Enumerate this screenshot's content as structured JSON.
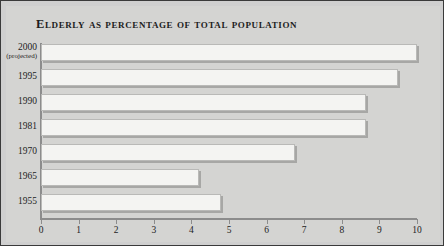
{
  "chart_data": {
    "type": "bar",
    "orientation": "horizontal",
    "title": "Elderly as percentage of total population",
    "xlabel": "",
    "ylabel": "",
    "xlim": [
      0,
      10
    ],
    "grid": false,
    "legend": null,
    "xticks": [
      "0",
      "1",
      "2",
      "3",
      "4",
      "5",
      "6",
      "7",
      "8",
      "9",
      "10"
    ],
    "categories": [
      "2000",
      "1995",
      "1990",
      "1981",
      "1970",
      "1965",
      "1955"
    ],
    "category_sublabels": [
      "(projected)",
      "",
      "",
      "",
      "",
      "",
      ""
    ],
    "values": [
      10.0,
      9.5,
      8.65,
      8.65,
      6.75,
      4.2,
      4.8
    ]
  },
  "colors": {
    "panel_background": "#d4d4d2",
    "frame_border": "#3a3a3a",
    "bar_fill": "#f4f4f2",
    "bar_border": "#b9b9b7",
    "bar_shadow": "#a7a7a5",
    "axis_line": "#8c8c8c",
    "text": "#1d1d1d"
  }
}
